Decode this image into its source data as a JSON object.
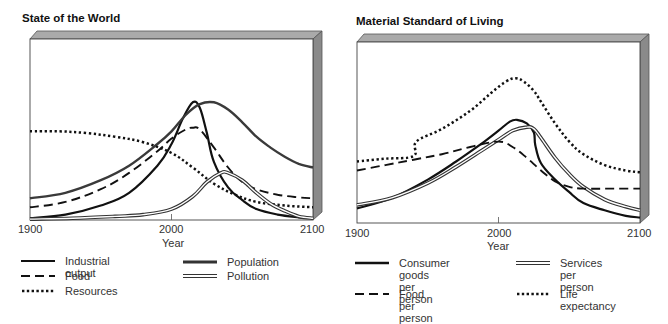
{
  "chart_data": [
    {
      "type": "line",
      "title": "State of the World",
      "xlabel": "Year",
      "ylabel": "",
      "xlim": [
        1900,
        2100
      ],
      "ylim": [
        0,
        100
      ],
      "x_ticks": [
        "1900",
        "2000",
        "2100"
      ],
      "grid": false,
      "legend_position": "bottom",
      "series": [
        {
          "name": "Industrial output",
          "style": "solid-thick",
          "x": [
            1900,
            1925,
            1950,
            1970,
            1990,
            2000,
            2008,
            2015,
            2020,
            2025,
            2030,
            2040,
            2050,
            2060,
            2075,
            2090,
            2100
          ],
          "y": [
            1,
            3,
            8,
            15,
            30,
            42,
            56,
            65,
            62,
            48,
            32,
            18,
            11,
            6,
            3,
            1.5,
            1
          ]
        },
        {
          "name": "Population",
          "style": "solid-thick-gray",
          "x": [
            1900,
            1925,
            1950,
            1970,
            1990,
            2000,
            2010,
            2020,
            2030,
            2040,
            2050,
            2060,
            2070,
            2080,
            2090,
            2100
          ],
          "y": [
            12,
            15,
            22,
            30,
            42,
            49,
            58,
            64,
            65,
            61,
            54,
            46,
            40,
            35,
            31,
            29
          ]
        },
        {
          "name": "Food",
          "style": "dashed",
          "x": [
            1900,
            1925,
            1950,
            1970,
            1990,
            2000,
            2010,
            2015,
            2020,
            2030,
            2040,
            2050,
            2060,
            2075,
            2090,
            2100
          ],
          "y": [
            7,
            10,
            17,
            26,
            38,
            45,
            50,
            51,
            50,
            40,
            29,
            21,
            17,
            14,
            12.5,
            12
          ]
        },
        {
          "name": "Resources",
          "style": "dotted",
          "x": [
            1900,
            1920,
            1940,
            1960,
            1980,
            2000,
            2015,
            2030,
            2045,
            2060,
            2080,
            2100
          ],
          "y": [
            49,
            49,
            48,
            46,
            43,
            37,
            29,
            20,
            14,
            10,
            8,
            7
          ]
        },
        {
          "name": "Pollution",
          "style": "double",
          "x": [
            1900,
            1930,
            1960,
            1980,
            2000,
            2015,
            2025,
            2035,
            2040,
            2050,
            2060,
            2070,
            2080,
            2090,
            2100
          ],
          "y": [
            0.5,
            1,
            2,
            3,
            6,
            13,
            21,
            26,
            26,
            22,
            15,
            9,
            5,
            2,
            1
          ]
        }
      ]
    },
    {
      "type": "line",
      "title": "Material Standard of Living",
      "xlabel": "Year",
      "ylabel": "",
      "xlim": [
        1900,
        2100
      ],
      "ylim": [
        0,
        100
      ],
      "x_ticks": [
        "1900",
        "2000",
        "2100"
      ],
      "grid": false,
      "legend_position": "bottom",
      "series": [
        {
          "name": "Consumer goods per person",
          "style": "solid-thick",
          "x": [
            1900,
            1925,
            1950,
            1970,
            1990,
            2000,
            2008,
            2013,
            2020,
            2025,
            2026,
            2030,
            2040,
            2050,
            2060,
            2075,
            2090,
            2100
          ],
          "y": [
            8,
            14,
            24,
            34,
            45,
            51,
            56,
            57,
            55,
            50,
            43,
            33,
            24,
            17,
            11,
            7,
            4,
            3
          ]
        },
        {
          "name": "Services per person",
          "style": "double",
          "x": [
            1900,
            1925,
            1950,
            1970,
            1990,
            2000,
            2010,
            2020,
            2025,
            2030,
            2040,
            2050,
            2060,
            2075,
            2090,
            2100
          ],
          "y": [
            10,
            14,
            22,
            31,
            41,
            46,
            51,
            53,
            52,
            47,
            36,
            27,
            20,
            13,
            9,
            7
          ]
        },
        {
          "name": "Food per person",
          "style": "dashed",
          "x": [
            1900,
            1920,
            1940,
            1960,
            1980,
            2000,
            2010,
            2020,
            2030,
            2040,
            2050,
            2060,
            2080,
            2100
          ],
          "y": [
            29,
            32,
            35,
            38,
            42,
            45,
            42,
            36,
            29,
            23,
            20,
            19,
            19,
            19
          ]
        },
        {
          "name": "Life expectancy",
          "style": "dotted",
          "x": [
            1900,
            1920,
            1940,
            1942,
            1960,
            1980,
            1995,
            2005,
            2012,
            2018,
            2025,
            2030,
            2040,
            2050,
            2060,
            2075,
            2090,
            2100
          ],
          "y": [
            34,
            35.5,
            37,
            45,
            52,
            62,
            72,
            78,
            80,
            78,
            73,
            67,
            55,
            45,
            38,
            32,
            29,
            28
          ]
        }
      ]
    }
  ],
  "charts": {
    "left": {
      "title": "State of the World",
      "ticks": {
        "t1900": "1900",
        "t2000": "2000",
        "t2100": "2100"
      },
      "xlabel": "Year",
      "legend": {
        "industrial": "Industrial output",
        "food": "Food",
        "resources": "Resources",
        "population": "Population",
        "pollution": "Pollution"
      }
    },
    "right": {
      "title": "Material Standard of Living",
      "ticks": {
        "t1900": "1900",
        "t2000": "2000",
        "t2100": "2100"
      },
      "xlabel": "Year",
      "legend": {
        "consumer": "Consumer goods\nper person",
        "services": "Services\nper person",
        "food": "Food per person",
        "life": "Life expectancy"
      }
    }
  },
  "colors": {
    "frame_top": "#a9a9a9",
    "frame_side": "#8c8c8c",
    "line_dark": "#111111",
    "line_gray": "#444444"
  }
}
